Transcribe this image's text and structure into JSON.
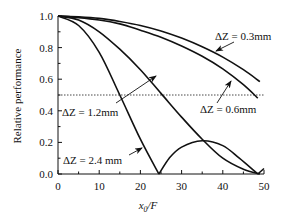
{
  "chart_data": {
    "type": "line",
    "title": "",
    "xlabel": "x0/F",
    "xlabel_main": "x",
    "xlabel_sub": "0",
    "xlabel_tail": "/F",
    "ylabel": "Relative performance",
    "xlim": [
      0,
      50
    ],
    "ylim": [
      0.0,
      1.0
    ],
    "grid": false,
    "legend": "inline annotations",
    "x_ticks": [
      0,
      10,
      20,
      30,
      40,
      50
    ],
    "x_tick_labels": [
      "0",
      "10",
      "20",
      "30",
      "40",
      "50"
    ],
    "y_ticks": [
      0.0,
      0.2,
      0.4,
      0.6,
      0.8,
      1.0
    ],
    "y_tick_labels": [
      "0.0",
      "0.2",
      "0.4",
      "0.6",
      "0.8",
      "1.0"
    ],
    "reference_line": {
      "y": 0.5,
      "style": "dotted"
    },
    "series": [
      {
        "name": "ΔZ = 0.3mm",
        "x": [
          0,
          5,
          10,
          15,
          20,
          25,
          30,
          35,
          40,
          45,
          49
        ],
        "values": [
          1.0,
          0.995,
          0.985,
          0.965,
          0.94,
          0.905,
          0.86,
          0.805,
          0.74,
          0.66,
          0.585
        ]
      },
      {
        "name": "ΔZ = 0.6mm",
        "x": [
          0,
          5,
          10,
          15,
          20,
          25,
          30,
          35,
          40,
          45,
          48.5
        ],
        "values": [
          1.0,
          0.99,
          0.975,
          0.95,
          0.91,
          0.865,
          0.81,
          0.745,
          0.665,
          0.565,
          0.48
        ]
      },
      {
        "name": "ΔZ = 1.2mm",
        "x": [
          0,
          5,
          10,
          15,
          20,
          25,
          30,
          35,
          40,
          45,
          49
        ],
        "values": [
          1.0,
          0.975,
          0.9,
          0.79,
          0.66,
          0.51,
          0.36,
          0.22,
          0.1,
          0.03,
          0.0
        ]
      },
      {
        "name": "ΔZ = 2.4mm",
        "x": [
          0,
          5,
          10,
          15,
          20,
          24.5,
          27,
          30,
          35,
          40,
          44,
          48.5,
          50
        ],
        "values": [
          1.0,
          0.94,
          0.77,
          0.5,
          0.22,
          0.0,
          0.1,
          0.17,
          0.21,
          0.18,
          0.1,
          0.0,
          0.035
        ]
      }
    ],
    "annotations": [
      {
        "text": "ΔZ = 0.3mm",
        "target_series": "ΔZ = 0.3mm"
      },
      {
        "text": "ΔZ = 0.6mm",
        "target_series": "ΔZ = 0.6mm"
      },
      {
        "text": "ΔZ = 1.2mm",
        "target_series": "ΔZ = 1.2mm"
      },
      {
        "text": "ΔZ = 2.4 mm",
        "target_series": "ΔZ = 2.4mm"
      }
    ]
  }
}
